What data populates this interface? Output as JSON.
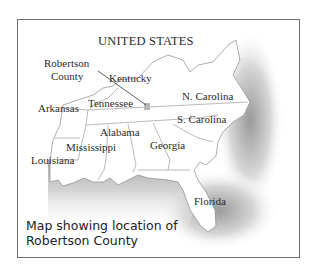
{
  "map": {
    "title": "UNITED STATES",
    "highlight": {
      "label_line1": "Robertson",
      "label_line2": "County",
      "color": "#b8b8b8"
    },
    "states": [
      {
        "name": "Kentucky"
      },
      {
        "name": "Tennessee"
      },
      {
        "name": "Arkansas"
      },
      {
        "name": "N. Carolina"
      },
      {
        "name": "S. Carolina"
      },
      {
        "name": "Alabama"
      },
      {
        "name": "Mississippi"
      },
      {
        "name": "Georgia"
      },
      {
        "name": "Louisiana"
      },
      {
        "name": "Florida"
      }
    ],
    "caption": "Map showing location of\nRobertson County",
    "colors": {
      "border": "#6f6f6f",
      "state_line": "#8a8a8a",
      "water_shade": "#c8c8c8",
      "land": "#ffffff"
    }
  }
}
